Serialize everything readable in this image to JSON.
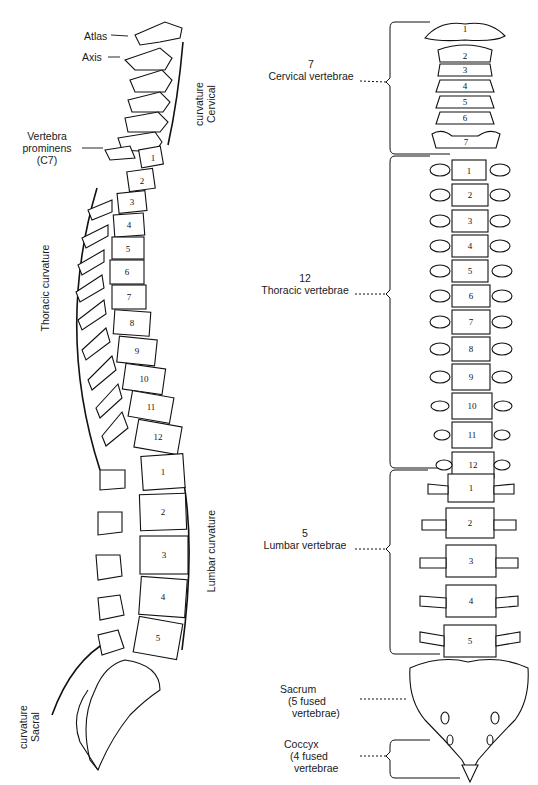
{
  "diagram": {
    "lateral_view": {
      "labels": {
        "atlas": "Atlas",
        "axis": "Axis",
        "vertebra_prominens": [
          "Vertebra",
          "prominens",
          "(C7)"
        ],
        "cervical_curvature": [
          "Cervical",
          "curvature"
        ],
        "thoracic_curvature": "Thoracic curvature",
        "lumbar_curvature": "Lumbar curvature",
        "sacral_curvature": [
          "Sacral",
          "curvature"
        ]
      },
      "cervical_numbers": [
        "1",
        "2"
      ],
      "thoracic_numbers": [
        "1",
        "2",
        "3",
        "4",
        "5",
        "6",
        "7",
        "8",
        "9",
        "10",
        "11",
        "12"
      ],
      "lumbar_numbers": [
        "1",
        "2",
        "3",
        "4",
        "5"
      ]
    },
    "anterior_view": {
      "groups": [
        {
          "count": "7",
          "name": "Cervical vertebrae"
        },
        {
          "count": "12",
          "name": "Thoracic vertebrae"
        },
        {
          "count": "5",
          "name": "Lumbar vertebrae"
        }
      ],
      "sacrum": [
        "Sacrum",
        "(5 fused",
        "vertebrae)"
      ],
      "coccyx": [
        "Coccyx",
        "(4 fused",
        "vertebrae"
      ],
      "cervical_numbers": [
        "1",
        "2",
        "3",
        "4",
        "5",
        "6",
        "7"
      ],
      "thoracic_numbers": [
        "1",
        "2",
        "3",
        "4",
        "5",
        "6",
        "7",
        "8",
        "9",
        "10",
        "11",
        "12"
      ],
      "lumbar_numbers": [
        "1",
        "2",
        "3",
        "4",
        "5"
      ]
    }
  }
}
